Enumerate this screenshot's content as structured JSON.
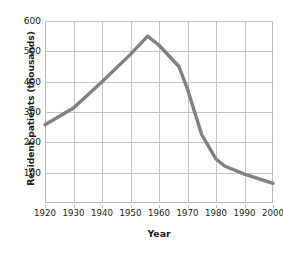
{
  "chart_data": {
    "type": "line",
    "title": "",
    "xlabel": "Year",
    "ylabel": "Resident patients (thousands)",
    "xlim": [
      1920,
      2000
    ],
    "ylim": [
      0,
      600
    ],
    "grid": true,
    "legend": null,
    "line_color": "#808080",
    "grid_color": "#c4c4c4",
    "frame_color": "#b9b9b9",
    "xticks": [
      1920,
      1930,
      1940,
      1950,
      1960,
      1970,
      1980,
      1990,
      2000
    ],
    "xtick_labels": [
      "1920",
      "1930",
      "1940",
      "1950",
      "1960",
      "1970",
      "1980",
      "1990",
      "2000"
    ],
    "yticks": [
      100,
      200,
      300,
      400,
      500,
      600
    ],
    "ytick_labels": [
      "100",
      "200",
      "300",
      "400",
      "500",
      "600"
    ],
    "series": [
      {
        "name": "Resident patients",
        "x": [
          1920,
          1930,
          1940,
          1950,
          1956,
          1960,
          1967,
          1970,
          1975,
          1980,
          1983,
          1990,
          2000
        ],
        "values": [
          258,
          313,
          400,
          490,
          550,
          520,
          450,
          375,
          225,
          145,
          122,
          95,
          65
        ]
      }
    ]
  },
  "axis": {
    "y_title": "Resident patients (thousands)",
    "x_title": "Year"
  }
}
